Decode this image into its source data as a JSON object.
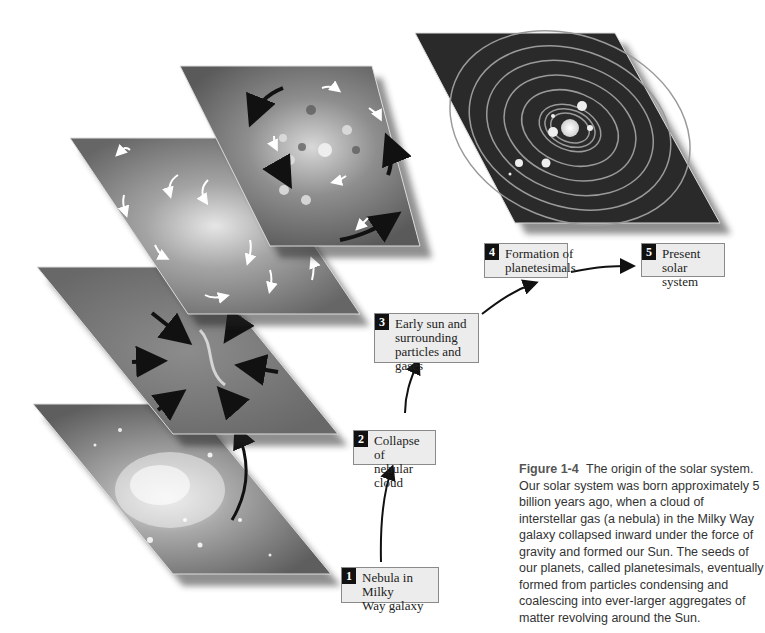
{
  "figure": {
    "number_label": "Figure 1-4",
    "caption": "The origin of the solar system. Our solar system was born approximately 5 billion years ago, when a cloud of interstellar gas (a nebula) in the Milky Way galaxy collapsed inward under the force of gravity and formed our Sun. The seeds of our planets, called planetesimals, eventually formed from particles condensing and coalescing into ever-larger aggregates of matter revolving around the Sun."
  },
  "stages": [
    {
      "num": "1",
      "label": "Nebula in Milky\nWay galaxy",
      "panel": "galaxy-nebula"
    },
    {
      "num": "2",
      "label": "Collapse of\nnebular cloud",
      "panel": "collapsing-cloud"
    },
    {
      "num": "3",
      "label": "Early sun and\nsurrounding\nparticles and gases",
      "panel": "swirling-disk"
    },
    {
      "num": "4",
      "label": "Formation of\nplanetesimals",
      "panel": "planetesimal-disk"
    },
    {
      "num": "5",
      "label": "Present solar\nsystem",
      "panel": "solar-system-orbits"
    }
  ],
  "colors": {
    "panel_gray": "#6e6e6e",
    "panel_dark": "#2a2a2a",
    "label_bg": "#ececec",
    "number_bg": "#111111",
    "arrow": "#111111"
  }
}
